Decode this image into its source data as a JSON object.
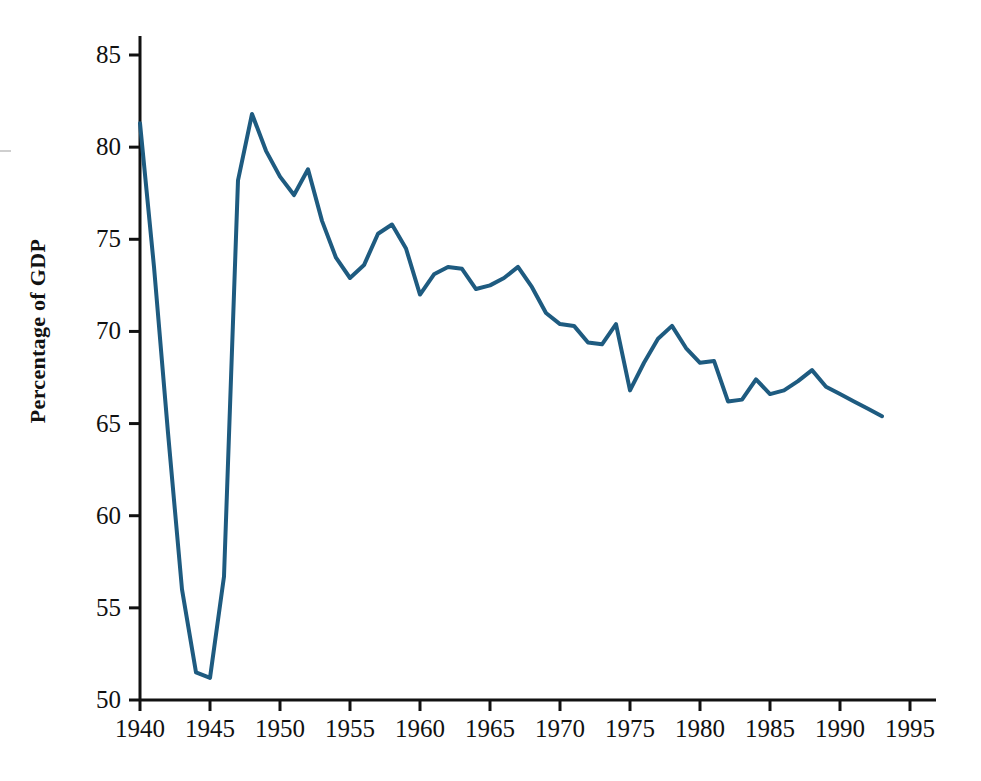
{
  "figure": {
    "background_color": "#ffffff",
    "line_color": "#1e5b80",
    "axis_color": "#111111"
  },
  "axes": {
    "y_title": "Percentage of GDP",
    "x_title": "",
    "y_ticks": [
      "50",
      "55",
      "60",
      "65",
      "70",
      "75",
      "80",
      "85"
    ],
    "x_ticks": [
      "1940",
      "1945",
      "1950",
      "1955",
      "1960",
      "1965",
      "1970",
      "1975",
      "1980",
      "1985",
      "1990",
      "1995"
    ]
  },
  "chart_data": {
    "type": "line",
    "title": "",
    "subtitle": "",
    "xlabel": "",
    "ylabel": "Percentage of GDP",
    "xlim": [
      1940,
      1995
    ],
    "ylim": [
      50,
      85
    ],
    "grid": false,
    "legend": null,
    "legend_position": "none",
    "x_tick_interval": 5,
    "y_tick_interval": 5,
    "annotations": [],
    "series": [
      {
        "name": "Percentage of GDP",
        "color": "#1e5b80",
        "line_width": 4,
        "x": [
          1940,
          1941,
          1942,
          1943,
          1944,
          1945,
          1946,
          1947,
          1948,
          1949,
          1950,
          1951,
          1952,
          1953,
          1954,
          1955,
          1956,
          1957,
          1958,
          1959,
          1960,
          1961,
          1962,
          1963,
          1964,
          1965,
          1966,
          1967,
          1968,
          1969,
          1970,
          1971,
          1972,
          1973,
          1974,
          1975,
          1976,
          1977,
          1978,
          1979,
          1980,
          1981,
          1982,
          1983,
          1984,
          1985,
          1986,
          1987,
          1988,
          1989,
          1990,
          1991,
          1992,
          1993
        ],
        "y": [
          81.3,
          73.5,
          64.5,
          56.0,
          51.5,
          51.2,
          56.7,
          78.2,
          81.8,
          79.8,
          78.4,
          77.4,
          78.8,
          76.0,
          74.0,
          72.9,
          73.6,
          75.3,
          75.8,
          74.5,
          72.0,
          73.1,
          73.5,
          73.4,
          72.3,
          72.5,
          72.9,
          73.5,
          72.4,
          71.0,
          70.4,
          70.3,
          69.4,
          69.3,
          70.4,
          66.8,
          68.3,
          69.6,
          70.3,
          69.1,
          68.3,
          68.4,
          66.2,
          66.3,
          67.4,
          66.6,
          66.8,
          67.3,
          67.9,
          67.0,
          66.6,
          66.2,
          65.8,
          65.4
        ]
      }
    ]
  }
}
